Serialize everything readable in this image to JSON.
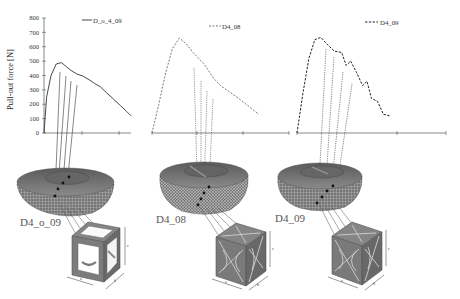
{
  "figure": {
    "y_axis_title": "Pull-out force [N]",
    "panels": [
      {
        "id": "D4_o_09",
        "legend": "D_o_4_09",
        "line_style": "solid",
        "label": "D4_o_09",
        "lattice": "cubic-frame"
      },
      {
        "id": "D4_08",
        "legend": "D4_08",
        "line_style": "dashed-light",
        "label": "D4_08",
        "lattice": "octet-truss"
      },
      {
        "id": "D4_09",
        "legend": "D4_09",
        "line_style": "dashed-bold",
        "label": "D4_09",
        "lattice": "octet-truss"
      }
    ],
    "dimension_labels": {
      "a": "a",
      "b": "b",
      "c": "c"
    },
    "colors": {
      "line": "#222222",
      "axis": "#555555",
      "dome": "#6f6f6f",
      "lattice": "#7a7a7a",
      "label": "#666666"
    }
  },
  "chart_data": [
    {
      "type": "line",
      "title": "",
      "legend": [
        "D_o_4_09"
      ],
      "ylabel": "Pull-out force [N]",
      "xlabel": "",
      "ylim": [
        0,
        800
      ],
      "yticks": [
        0,
        100,
        200,
        300,
        400,
        500,
        600,
        700,
        800
      ],
      "xticks_labels": [],
      "x": [
        0,
        0.03,
        0.08,
        0.14,
        0.2,
        0.26,
        0.3,
        0.38,
        0.45,
        0.52,
        0.58,
        0.65,
        0.72,
        0.8,
        0.88,
        0.95,
        1.0
      ],
      "series": [
        {
          "name": "D_o_4_09",
          "style": "solid",
          "values": [
            0,
            250,
            400,
            480,
            490,
            460,
            440,
            410,
            395,
            370,
            345,
            320,
            280,
            235,
            190,
            150,
            120
          ]
        }
      ],
      "grid": false,
      "legend_position": "top-right"
    },
    {
      "type": "line",
      "title": "",
      "legend": [
        "D4_08"
      ],
      "ylabel": "",
      "xlabel": "",
      "ylim": [
        0,
        800
      ],
      "x": [
        0,
        0.05,
        0.1,
        0.15,
        0.2,
        0.25,
        0.3,
        0.38,
        0.45,
        0.5,
        0.56,
        0.62,
        0.7,
        0.78
      ],
      "series": [
        {
          "name": "D4_08",
          "style": "dashed",
          "values": [
            0,
            200,
            420,
            590,
            660,
            620,
            560,
            480,
            380,
            330,
            290,
            250,
            190,
            130
          ]
        }
      ],
      "grid": false,
      "legend_position": "top-right"
    },
    {
      "type": "line",
      "title": "",
      "legend": [
        "D4_09"
      ],
      "ylabel": "",
      "xlabel": "",
      "ylim": [
        0,
        800
      ],
      "x": [
        0,
        0.04,
        0.08,
        0.12,
        0.16,
        0.2,
        0.25,
        0.3,
        0.33,
        0.36,
        0.4,
        0.44,
        0.47,
        0.5,
        0.54,
        0.58,
        0.62
      ],
      "series": [
        {
          "name": "D4_09",
          "style": "dashed",
          "values": [
            0,
            280,
            520,
            650,
            665,
            620,
            570,
            560,
            470,
            500,
            420,
            330,
            360,
            240,
            220,
            130,
            120
          ]
        }
      ],
      "grid": false,
      "legend_position": "top-right"
    }
  ]
}
